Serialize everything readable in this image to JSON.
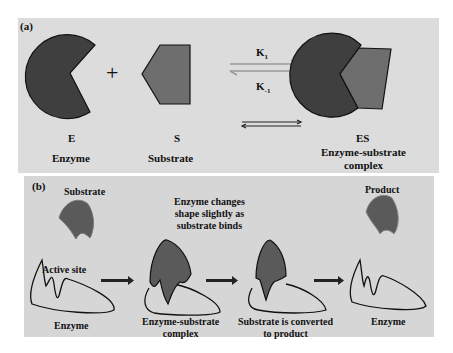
{
  "panel_a": {
    "label": "(a)",
    "enzyme_symbol": "E",
    "substrate_symbol": "S",
    "complex_symbol": "ES",
    "plus": "+",
    "k_forward": "K",
    "k_forward_sub": "1",
    "k_reverse": "K",
    "k_reverse_sub": "-1",
    "enzyme_caption": "Enzyme",
    "substrate_caption": "Substrate",
    "complex_caption_line1": "Enzyme-substrate",
    "complex_caption_line2": "complex",
    "colors": {
      "enzyme": "#3f3f3f",
      "substrate": "#6e6e6e",
      "background": "#dcdcdc",
      "arrow": "#9a9a9a"
    }
  },
  "panel_b": {
    "label": "(b)",
    "substrate_label": "Substrate",
    "active_site_label": "Active site",
    "enzyme_label_1": "Enzyme",
    "shape_change_line1": "Enzyme changes",
    "shape_change_line2": "shape slightly as",
    "shape_change_line3": "substrate binds",
    "complex_line1": "Enzyme-substrate",
    "complex_line2": "complex",
    "converted_line1": "Substrate is converted",
    "converted_line2": "to product",
    "product_label": "Product",
    "enzyme_label_2": "Enzyme",
    "colors": {
      "substrate": "#5a5a5a",
      "outline": "#111111",
      "background": "#d6d6d6",
      "arrow": "#222222"
    }
  }
}
